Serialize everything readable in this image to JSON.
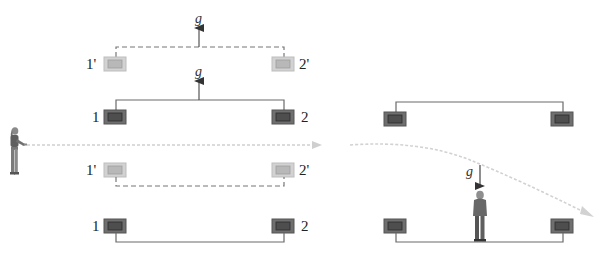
{
  "diagram": {
    "colors": {
      "box_dark_outer": "#6f6f6f",
      "box_dark_inner": "#4e4e4e",
      "box_light_outer": "#c9c9c9",
      "box_light_inner": "#b3b3b3",
      "wire": "#6a6a6a",
      "trajectory": "#cfcfcf"
    },
    "left_panel": {
      "upper_group": {
        "moved_labels": {
          "left": "1'",
          "right": "2'"
        },
        "original_labels": {
          "left": "1",
          "right": "2"
        },
        "accel_labels": [
          "g",
          "g"
        ]
      },
      "lower_group": {
        "moved_labels": {
          "left": "1'",
          "right": "2'"
        },
        "original_labels": {
          "left": "1",
          "right": "2"
        }
      },
      "observer": "woman-with-flashlight"
    },
    "right_panel": {
      "gravity_label": "g",
      "observer": "man-standing"
    }
  }
}
